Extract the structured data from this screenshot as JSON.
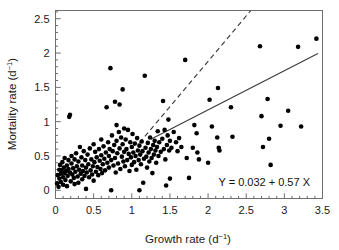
{
  "figure": {
    "background": "#ffffff",
    "frame_color": "#6e6e6e",
    "point_color": "#000000",
    "line_color": "#3a3a3a"
  },
  "axes": {
    "x_title_main": "Growth rate (d",
    "x_title_sup": "−1",
    "x_title_tail": ")",
    "y_title_main": "Mortality rate (d",
    "y_title_sup": "−1",
    "y_title_tail": ")",
    "x_tick_labels": [
      "0",
      "0.5",
      "1",
      "1.5",
      "2",
      "2.5",
      "3",
      "3.5"
    ],
    "y_tick_labels": [
      "0",
      "0.5",
      "1",
      "1.5",
      "2",
      "2.5"
    ]
  },
  "annotation": {
    "equation": "Y = 0.032 + 0.57 X"
  },
  "chart_data": {
    "type": "scatter",
    "title": "",
    "xlabel": "Growth rate (d−1)",
    "ylabel": "Mortality rate (d−1)",
    "xlim": [
      0,
      3.5
    ],
    "ylim": [
      -0.12,
      2.62
    ],
    "grid": false,
    "legend": null,
    "x_ticks": [
      0,
      0.5,
      1,
      1.5,
      2,
      2.5,
      3,
      3.5
    ],
    "y_ticks": [
      0,
      0.5,
      1,
      1.5,
      2,
      2.5
    ],
    "x_minor_tick_step": 0.1,
    "y_minor_tick_step": 0.1,
    "marker": {
      "shape": "circle",
      "size_px": 4.6,
      "color": "#000000"
    },
    "annotations": [
      {
        "text": "Y = 0.032 + 0.57 X",
        "x": 2.55,
        "y": 0.08
      }
    ],
    "series": [
      {
        "name": "observations",
        "type": "scatter",
        "points": [
          [
            0.02,
            0.1
          ],
          [
            0.03,
            0.22
          ],
          [
            0.04,
            0.05
          ],
          [
            0.05,
            0.3
          ],
          [
            0.05,
            0.17
          ],
          [
            0.06,
            0.37
          ],
          [
            0.07,
            0.24
          ],
          [
            0.07,
            0.12
          ],
          [
            0.08,
            0.29
          ],
          [
            0.09,
            0.41
          ],
          [
            0.1,
            0.19
          ],
          [
            0.1,
            0.08
          ],
          [
            0.11,
            0.33
          ],
          [
            0.12,
            0.25
          ],
          [
            0.12,
            0.47
          ],
          [
            0.13,
            0.15
          ],
          [
            0.14,
            0.28
          ],
          [
            0.15,
            0.36
          ],
          [
            0.15,
            0.06
          ],
          [
            0.16,
            0.21
          ],
          [
            0.17,
            0.44
          ],
          [
            0.17,
            0.31
          ],
          [
            0.18,
            1.07
          ],
          [
            0.19,
            1.1
          ],
          [
            0.19,
            0.26
          ],
          [
            0.2,
            0.13
          ],
          [
            0.21,
            0.39
          ],
          [
            0.21,
            0.5
          ],
          [
            0.22,
            0.23
          ],
          [
            0.23,
            0.32
          ],
          [
            0.24,
            0.18
          ],
          [
            0.25,
            0.45
          ],
          [
            0.25,
            0.09
          ],
          [
            0.26,
            0.27
          ],
          [
            0.27,
            0.54
          ],
          [
            0.28,
            0.35
          ],
          [
            0.29,
            0.2
          ],
          [
            0.3,
            0.42
          ],
          [
            0.3,
            0.11
          ],
          [
            0.31,
            0.3
          ],
          [
            0.32,
            0.63
          ],
          [
            0.33,
            0.24
          ],
          [
            0.34,
            0.48
          ],
          [
            0.35,
            0.16
          ],
          [
            0.35,
            0.36
          ],
          [
            0.36,
            0.28
          ],
          [
            0.37,
            0.57
          ],
          [
            0.38,
            0.21
          ],
          [
            0.39,
            0.44
          ],
          [
            0.4,
            0.33
          ],
          [
            0.4,
            0.02
          ],
          [
            0.41,
            0.26
          ],
          [
            0.42,
            0.52
          ],
          [
            0.43,
            0.38
          ],
          [
            0.44,
            0.19
          ],
          [
            0.45,
            0.61
          ],
          [
            0.46,
            0.29
          ],
          [
            0.47,
            0.45
          ],
          [
            0.48,
            0.23
          ],
          [
            0.49,
            0.35
          ],
          [
            0.5,
            0.67
          ],
          [
            0.5,
            0.14
          ],
          [
            0.51,
            0.41
          ],
          [
            0.52,
            0.56
          ],
          [
            0.53,
            0.27
          ],
          [
            0.54,
            0.48
          ],
          [
            0.55,
            0.34
          ],
          [
            0.56,
            0.22
          ],
          [
            0.57,
            0.6
          ],
          [
            0.58,
            0.43
          ],
          [
            0.59,
            0.31
          ],
          [
            0.6,
            0.74
          ],
          [
            0.6,
            0.51
          ],
          [
            0.61,
            0.25
          ],
          [
            0.62,
            0.38
          ],
          [
            0.63,
            0.64
          ],
          [
            0.64,
            0.46
          ],
          [
            0.65,
            0.29
          ],
          [
            0.66,
            0.55
          ],
          [
            0.67,
            1.21
          ],
          [
            0.68,
            0.4
          ],
          [
            0.69,
            0.7
          ],
          [
            0.7,
            0.33
          ],
          [
            0.7,
            0.5
          ],
          [
            0.71,
            0.6
          ],
          [
            0.72,
            1.78
          ],
          [
            0.73,
            0.44
          ],
          [
            0.73,
            0.0
          ],
          [
            0.74,
            0.8
          ],
          [
            0.75,
            0.57
          ],
          [
            0.76,
            0.36
          ],
          [
            0.77,
            0.66
          ],
          [
            0.78,
            1.29
          ],
          [
            0.78,
            0.47
          ],
          [
            0.79,
            0.26
          ],
          [
            0.8,
            0.95
          ],
          [
            0.8,
            0.72
          ],
          [
            0.81,
            0.54
          ],
          [
            0.82,
            0.39
          ],
          [
            0.83,
            0.85
          ],
          [
            0.84,
            1.25
          ],
          [
            0.84,
            0.61
          ],
          [
            0.85,
            0.31
          ],
          [
            0.86,
            0.77
          ],
          [
            0.87,
            0.49
          ],
          [
            0.88,
            1.47
          ],
          [
            0.88,
            0.67
          ],
          [
            0.89,
            0.42
          ],
          [
            0.9,
            0.9
          ],
          [
            0.9,
            0.56
          ],
          [
            0.91,
            0.35
          ],
          [
            0.92,
            0.74
          ],
          [
            0.93,
            0.6
          ],
          [
            0.94,
            0.44
          ],
          [
            0.95,
            0.88
          ],
          [
            0.96,
            0.53
          ],
          [
            0.97,
            0.28
          ],
          [
            0.98,
            0.7
          ],
          [
            0.99,
            0.48
          ],
          [
            1.0,
            0.63
          ],
          [
            1.0,
            0.37
          ],
          [
            1.01,
            0.82
          ],
          [
            1.02,
            0.55
          ],
          [
            1.03,
            0.41
          ],
          [
            1.04,
            0.68
          ],
          [
            1.05,
            0.5
          ],
          [
            1.06,
            0.3
          ],
          [
            1.07,
            0.76
          ],
          [
            1.08,
            0.58
          ],
          [
            1.09,
            0.44
          ],
          [
            1.1,
            0.0
          ],
          [
            1.1,
            0.65
          ],
          [
            1.11,
            0.52
          ],
          [
            1.12,
            0.38
          ],
          [
            1.13,
            0.71
          ],
          [
            1.14,
            0.57
          ],
          [
            1.15,
            0.11
          ],
          [
            1.16,
            0.46
          ],
          [
            1.17,
            1.67
          ],
          [
            1.18,
            0.62
          ],
          [
            1.19,
            0.49
          ],
          [
            1.2,
            0.33
          ],
          [
            1.21,
            0.69
          ],
          [
            1.22,
            0.55
          ],
          [
            1.23,
            0.42
          ],
          [
            1.24,
            0.77
          ],
          [
            1.25,
            0.6
          ],
          [
            1.26,
            0.47
          ],
          [
            1.27,
            0.25
          ],
          [
            1.28,
            0.66
          ],
          [
            1.29,
            0.52
          ],
          [
            1.3,
            0.72
          ],
          [
            1.31,
            0.58
          ],
          [
            1.32,
            0.4
          ],
          [
            1.33,
            0.63
          ],
          [
            1.34,
            0.86
          ],
          [
            1.35,
            0.5
          ],
          [
            1.36,
            0.7
          ],
          [
            1.38,
            0.56
          ],
          [
            1.4,
            0.75
          ],
          [
            1.41,
            1.3
          ],
          [
            1.42,
            0.6
          ],
          [
            1.43,
            0.88
          ],
          [
            1.44,
            0.45
          ],
          [
            1.45,
            0.07
          ],
          [
            1.46,
            0.66
          ],
          [
            1.47,
            0.8
          ],
          [
            1.48,
            1.03
          ],
          [
            1.49,
            0.58
          ],
          [
            1.5,
            0.72
          ],
          [
            1.5,
            0.17
          ],
          [
            1.52,
            0.62
          ],
          [
            1.55,
            0.85
          ],
          [
            1.58,
            0.7
          ],
          [
            1.6,
            0.57
          ],
          [
            1.62,
            0.76
          ],
          [
            1.65,
            0.63
          ],
          [
            1.7,
            1.9
          ],
          [
            1.72,
            0.47
          ],
          [
            1.75,
            0.18
          ],
          [
            1.8,
            0.62
          ],
          [
            1.82,
            0.95
          ],
          [
            1.85,
            0.83
          ],
          [
            1.86,
            0.55
          ],
          [
            1.88,
            0.45
          ],
          [
            2.0,
            0.4
          ],
          [
            2.02,
            1.32
          ],
          [
            2.05,
            0.93
          ],
          [
            2.12,
            0.77
          ],
          [
            2.13,
            1.49
          ],
          [
            2.14,
            0.62
          ],
          [
            2.15,
            0.58
          ],
          [
            2.3,
            1.21
          ],
          [
            2.32,
            0.78
          ],
          [
            2.68,
            2.1
          ],
          [
            2.7,
            1.08
          ],
          [
            2.72,
            0.63
          ],
          [
            2.78,
            1.33
          ],
          [
            2.8,
            0.75
          ],
          [
            2.82,
            0.37
          ],
          [
            2.95,
            0.94
          ],
          [
            3.05,
            1.16
          ],
          [
            3.18,
            2.09
          ],
          [
            3.22,
            0.93
          ],
          [
            3.42,
            2.21
          ]
        ]
      }
    ],
    "fits": [
      {
        "name": "major-axis-fit",
        "style": "dashed",
        "color": "#3a3a3a",
        "x_from": 1.1,
        "y_from": 0.69,
        "x_to": 2.56,
        "y_to": 2.62
      },
      {
        "name": "regression-fit",
        "style": "solid",
        "color": "#3a3a3a",
        "equation": "Y = 0.032 + 0.57 X",
        "intercept": 0.032,
        "slope": 0.57,
        "x_from": 1.25,
        "y_from": 0.745,
        "x_to": 3.44,
        "y_to": 1.993
      }
    ]
  }
}
